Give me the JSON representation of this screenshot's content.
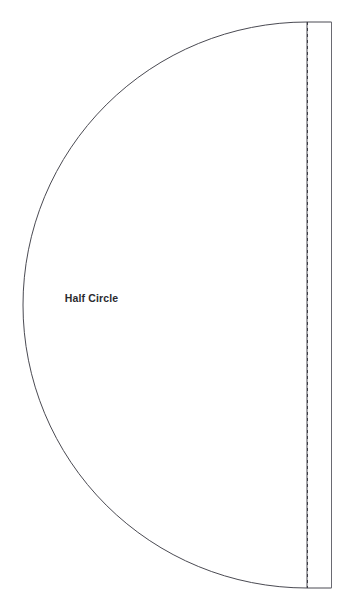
{
  "document": {
    "title": "Half Circle",
    "background_color": "#ffffff",
    "width": 353,
    "height": 616
  },
  "pattern": {
    "label": "Half Circle",
    "label_color": "#2b2b2f",
    "outline_color": "#4a4a52",
    "fold_line_color": "#3c3c44",
    "fill_color": "#ffffff",
    "line_width": 1,
    "pieces": [
      {
        "name": "half-circle-body",
        "kind": "semicircle-arc",
        "leftmost_x": 23,
        "straight_edge_x": 307,
        "top_y": 22,
        "bottom_y": 588,
        "center_y": 305,
        "radius_x": 284,
        "radius_y": 283,
        "stroke": "#4a4a52",
        "style": "solid"
      },
      {
        "name": "fold-line",
        "kind": "vertical-dashed-line",
        "x": 307,
        "top_y": 22,
        "bottom_y": 588,
        "stroke": "#3c3c44",
        "style": "dashed",
        "dash_pattern": "3 3"
      },
      {
        "name": "seam-allowance-edge",
        "kind": "vertical-solid-line",
        "x": 331,
        "top_y": 22,
        "bottom_y": 588,
        "stroke": "#6a6a72",
        "style": "solid"
      },
      {
        "name": "seam-allowance-top",
        "kind": "horizontal-solid-line",
        "y": 22,
        "left_x": 307,
        "right_x": 331,
        "stroke": "#4a4a52",
        "style": "solid"
      },
      {
        "name": "seam-allowance-bottom",
        "kind": "horizontal-solid-line",
        "y": 588,
        "left_x": 307,
        "right_x": 331,
        "stroke": "#4a4a52",
        "style": "solid"
      }
    ]
  }
}
